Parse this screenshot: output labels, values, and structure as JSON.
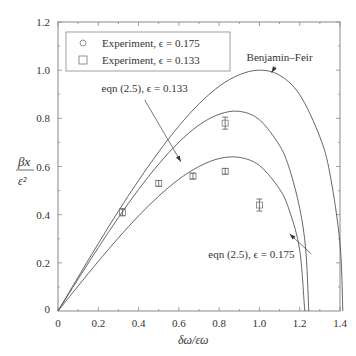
{
  "chart_data": {
    "type": "line",
    "title": "",
    "xlabel": "δω/εω",
    "ylabel_num": "βx",
    "ylabel_den": "ε²",
    "xlim": [
      0,
      1.4
    ],
    "ylim": [
      0,
      1.2
    ],
    "xticks": [
      0,
      0.2,
      0.4,
      0.6,
      0.8,
      1.0,
      1.2,
      1.4
    ],
    "xtick_labels": [
      "0",
      "0.2",
      "0.4",
      "0.6",
      "0.8",
      "1.0",
      "1.2",
      "1.4"
    ],
    "yticks": [
      0.2,
      0.4,
      0.6,
      0.8,
      1.0,
      1.2
    ],
    "ytick_labels": [
      "0.2",
      "0.4",
      "0.6",
      "0.8",
      "1.0",
      "1.2"
    ],
    "grid": false,
    "legend_position": "top-left",
    "legend": [
      {
        "marker": "circle",
        "label": "Experiment, ϵ = 0.175"
      },
      {
        "marker": "square",
        "label": "Experiment, ϵ = 0.133"
      }
    ],
    "series": [
      {
        "name": "Benjamin–Feir",
        "kind": "line",
        "x": [
          0,
          0.1,
          0.2,
          0.3,
          0.4,
          0.5,
          0.6,
          0.7,
          0.8,
          0.9,
          1.0,
          1.1,
          1.2,
          1.3,
          1.35,
          1.4,
          1.414
        ],
        "y": [
          0,
          0.141,
          0.28,
          0.415,
          0.542,
          0.661,
          0.768,
          0.86,
          0.933,
          0.981,
          1.0,
          0.979,
          0.898,
          0.723,
          0.57,
          0.28,
          0
        ]
      },
      {
        "name": "eqn (2.5), ϵ = 0.133",
        "kind": "line",
        "x": [
          0,
          0.1,
          0.2,
          0.3,
          0.4,
          0.5,
          0.6,
          0.7,
          0.8,
          0.9,
          1.0,
          1.1,
          1.15,
          1.2,
          1.23,
          1.245
        ],
        "y": [
          0,
          0.133,
          0.263,
          0.388,
          0.505,
          0.61,
          0.701,
          0.772,
          0.817,
          0.829,
          0.794,
          0.687,
          0.588,
          0.426,
          0.253,
          0
        ]
      },
      {
        "name": "eqn (2.5), ϵ = 0.175",
        "kind": "line",
        "x": [
          0,
          0.1,
          0.2,
          0.3,
          0.4,
          0.5,
          0.6,
          0.7,
          0.8,
          0.9,
          1.0,
          1.1,
          1.15,
          1.2,
          1.225
        ],
        "y": [
          0,
          0.104,
          0.206,
          0.304,
          0.395,
          0.477,
          0.547,
          0.6,
          0.633,
          0.638,
          0.604,
          0.506,
          0.414,
          0.252,
          0
        ]
      },
      {
        "name": "Experiment, ϵ = 0.133",
        "kind": "scatter",
        "marker": "square",
        "x": [
          0.32,
          0.5,
          0.67,
          0.83,
          0.83,
          1.0
        ],
        "y": [
          0.41,
          0.53,
          0.56,
          0.78,
          0.58,
          0.44
        ],
        "err": [
          0.015,
          0.012,
          0.012,
          0.025,
          0.012,
          0.025
        ]
      }
    ],
    "annotations": [
      {
        "text": "Benjamin–Feir",
        "target_series": 0,
        "label_at": [
          1.1,
          1.04
        ],
        "arrow_to": [
          1.06,
          0.99
        ]
      },
      {
        "text": "eqn (2.5), ϵ = 0.133",
        "target_series": 1,
        "label_at": [
          0.43,
          0.91
        ],
        "arrow_to": [
          0.61,
          0.62
        ]
      },
      {
        "text": "eqn (2.5), ϵ = 0.175",
        "target_series": 2,
        "label_at": [
          0.96,
          0.22
        ],
        "arrow_to": [
          1.15,
          0.32
        ]
      }
    ]
  }
}
